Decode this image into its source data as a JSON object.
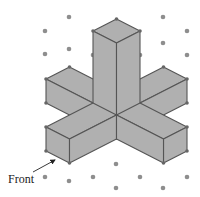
{
  "figure": {
    "label": "Front",
    "colors": {
      "face_fill": "#b0b0b0",
      "edge": "#555555",
      "grid_dot": "#8e8e8e",
      "vertex_dot": "#666666",
      "label": "#222222"
    },
    "grid_dots": [
      [
        69,
        17
      ],
      [
        45,
        31
      ],
      [
        163,
        17
      ],
      [
        187,
        31
      ],
      [
        69,
        49
      ],
      [
        45,
        54
      ],
      [
        163,
        43
      ],
      [
        187,
        55
      ],
      [
        93,
        55
      ],
      [
        140,
        55
      ],
      [
        45,
        177
      ],
      [
        69,
        181
      ],
      [
        93,
        177
      ],
      [
        116,
        164
      ],
      [
        116,
        188
      ],
      [
        140,
        177
      ],
      [
        163,
        188
      ],
      [
        187,
        177
      ]
    ],
    "faces": [
      {
        "name": "back-left-arm-top",
        "points": [
          [
            69.5,
            67
          ],
          [
            116.5,
            91
          ],
          [
            93,
            103
          ],
          [
            46,
            79
          ]
        ]
      },
      {
        "name": "back-left-arm-side",
        "points": [
          [
            46,
            79
          ],
          [
            93,
            103
          ],
          [
            93,
            127
          ],
          [
            46,
            103
          ]
        ]
      },
      {
        "name": "back-right-arm-top",
        "points": [
          [
            163.5,
            67
          ],
          [
            187,
            79
          ],
          [
            140,
            103
          ],
          [
            116.5,
            91
          ]
        ]
      },
      {
        "name": "back-right-arm-side",
        "points": [
          [
            187,
            79
          ],
          [
            140,
            103
          ],
          [
            140,
            127
          ],
          [
            187,
            103
          ]
        ]
      },
      {
        "name": "column-top",
        "points": [
          [
            116.5,
            19
          ],
          [
            140,
            31
          ],
          [
            116.5,
            43
          ],
          [
            93,
            31
          ]
        ]
      },
      {
        "name": "column-left-face",
        "points": [
          [
            93,
            31
          ],
          [
            116.5,
            43
          ],
          [
            116.5,
            139
          ],
          [
            93,
            127
          ]
        ]
      },
      {
        "name": "column-right-face",
        "points": [
          [
            116.5,
            43
          ],
          [
            140,
            31
          ],
          [
            140,
            127
          ],
          [
            116.5,
            139
          ]
        ]
      },
      {
        "name": "front-left-arm-top",
        "points": [
          [
            46,
            127
          ],
          [
            69.5,
            139
          ],
          [
            116.5,
            115
          ],
          [
            93,
            103
          ]
        ]
      },
      {
        "name": "front-left-arm-end",
        "points": [
          [
            46,
            127
          ],
          [
            69.5,
            139
          ],
          [
            69.5,
            163
          ],
          [
            46,
            151
          ]
        ]
      },
      {
        "name": "front-left-arm-side",
        "points": [
          [
            116.5,
            115
          ],
          [
            69.5,
            139
          ],
          [
            69.5,
            163
          ],
          [
            116.5,
            139
          ]
        ]
      },
      {
        "name": "front-right-arm-top",
        "points": [
          [
            116.5,
            115
          ],
          [
            140,
            103
          ],
          [
            187,
            127
          ],
          [
            163.5,
            139
          ]
        ]
      },
      {
        "name": "front-right-arm-end",
        "points": [
          [
            187,
            127
          ],
          [
            163.5,
            139
          ],
          [
            163.5,
            163
          ],
          [
            187,
            151
          ]
        ]
      },
      {
        "name": "front-right-arm-side",
        "points": [
          [
            116.5,
            115
          ],
          [
            163.5,
            139
          ],
          [
            163.5,
            163
          ],
          [
            116.5,
            139
          ]
        ]
      }
    ],
    "vertex_dots": [
      [
        116.5,
        19
      ],
      [
        93,
        31
      ],
      [
        140,
        31
      ],
      [
        69.5,
        67
      ],
      [
        46,
        79
      ],
      [
        46,
        103
      ],
      [
        163.5,
        67
      ],
      [
        187,
        79
      ],
      [
        187,
        103
      ],
      [
        46,
        127
      ],
      [
        46,
        151
      ],
      [
        69.5,
        163
      ],
      [
        187,
        127
      ],
      [
        187,
        151
      ],
      [
        163.5,
        163
      ]
    ],
    "arrow": {
      "from": [
        33,
        172
      ],
      "to": [
        55,
        160
      ]
    },
    "label_position": [
      8,
      183
    ]
  }
}
